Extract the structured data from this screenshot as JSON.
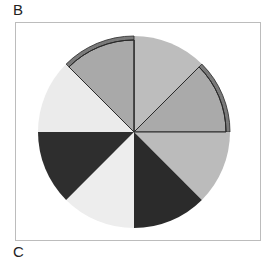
{
  "labels": {
    "top": "B",
    "bottom": "C"
  },
  "diagram": {
    "type": "sectored-circle",
    "center": [
      134,
      132
    ],
    "radius": 96,
    "sector_count": 8,
    "sectors": [
      {
        "start": 0,
        "end": 45,
        "fill": "#bdbdbd",
        "highlighted": false
      },
      {
        "start": 45,
        "end": 90,
        "fill": "#aaaaaa",
        "highlighted": true
      },
      {
        "start": 90,
        "end": 135,
        "fill": "#bbbbbb",
        "highlighted": false
      },
      {
        "start": 135,
        "end": 180,
        "fill": "#2b2b2b",
        "highlighted": false
      },
      {
        "start": 180,
        "end": 225,
        "fill": "#ededed",
        "highlighted": false
      },
      {
        "start": 225,
        "end": 270,
        "fill": "#2e2e2e",
        "highlighted": false
      },
      {
        "start": 270,
        "end": 315,
        "fill": "#ebebeb",
        "highlighted": false
      },
      {
        "start": 315,
        "end": 360,
        "fill": "#a9a9a9",
        "highlighted": true
      }
    ],
    "highlight_band_color": "#7a7a7a",
    "outline_color": "#2a2a2a"
  }
}
